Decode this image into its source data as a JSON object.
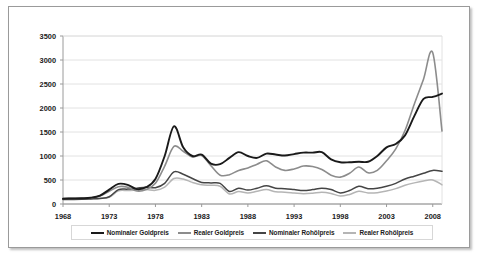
{
  "chart_data": {
    "type": "line",
    "title": "",
    "subtitle": "",
    "xlabel": "",
    "ylabel": "",
    "xlim": [
      1968,
      2009
    ],
    "ylim": [
      0,
      3500
    ],
    "ytick_step": 500,
    "yticks": [
      "0",
      "500",
      "1000",
      "1500",
      "2000",
      "2500",
      "3000",
      "3500"
    ],
    "xticks": [
      "1968",
      "1973",
      "1978",
      "1983",
      "1988",
      "1993",
      "1998",
      "2003",
      "2008"
    ],
    "grid": true,
    "grid_axis": "y",
    "legend_position": "bottom",
    "x": [
      1968,
      1969,
      1970,
      1971,
      1972,
      1973,
      1974,
      1975,
      1976,
      1977,
      1978,
      1979,
      1980,
      1981,
      1982,
      1983,
      1984,
      1985,
      1986,
      1987,
      1988,
      1989,
      1990,
      1991,
      1992,
      1993,
      1994,
      1995,
      1996,
      1997,
      1998,
      1999,
      2000,
      2001,
      2002,
      2003,
      2004,
      2005,
      2006,
      2007,
      2008,
      2009
    ],
    "series": [
      {
        "name": "Nominaler Goldpreis",
        "color": "#1a1a1a",
        "width": 1.9,
        "values": [
          110,
          115,
          120,
          130,
          175,
          300,
          420,
          400,
          310,
          350,
          520,
          1000,
          1620,
          1180,
          1000,
          1030,
          840,
          830,
          960,
          1080,
          1000,
          960,
          1050,
          1030,
          1010,
          1040,
          1070,
          1070,
          1080,
          930,
          870,
          870,
          880,
          880,
          1000,
          1180,
          1250,
          1430,
          1830,
          2190,
          2230,
          2300
        ]
      },
      {
        "name": "Realer Goldpreis",
        "color": "#8c8c8c",
        "width": 1.6,
        "values": [
          115,
          118,
          120,
          128,
          165,
          265,
          360,
          350,
          270,
          300,
          430,
          790,
          1200,
          1100,
          980,
          1010,
          800,
          600,
          610,
          700,
          750,
          830,
          900,
          770,
          700,
          730,
          790,
          780,
          720,
          600,
          560,
          640,
          770,
          650,
          700,
          900,
          1150,
          1530,
          2080,
          2600,
          3150,
          1520
        ]
      },
      {
        "name": "Nominaler Rohölpreis",
        "color": "#454545",
        "width": 1.5,
        "values": [
          95,
          95,
          97,
          105,
          115,
          150,
          300,
          310,
          330,
          350,
          340,
          430,
          670,
          620,
          530,
          450,
          440,
          430,
          260,
          330,
          290,
          330,
          380,
          330,
          320,
          300,
          280,
          300,
          330,
          300,
          230,
          280,
          370,
          320,
          330,
          370,
          430,
          520,
          580,
          640,
          700,
          680
        ]
      },
      {
        "name": "Realer Rohölpreis",
        "color": "#b5b5b5",
        "width": 1.5,
        "values": [
          100,
          100,
          102,
          108,
          118,
          140,
          275,
          280,
          290,
          300,
          285,
          350,
          530,
          520,
          450,
          400,
          390,
          370,
          210,
          260,
          230,
          265,
          300,
          255,
          245,
          230,
          215,
          225,
          245,
          220,
          165,
          200,
          265,
          230,
          235,
          270,
          320,
          390,
          440,
          480,
          500,
          400
        ]
      }
    ]
  },
  "legend": {
    "items": [
      {
        "label": "Nominaler Goldpreis",
        "color": "#1a1a1a"
      },
      {
        "label": "Realer Goldpreis",
        "color": "#8c8c8c"
      },
      {
        "label": "Nominaler Rohölpreis",
        "color": "#454545"
      },
      {
        "label": "Realer Rohölpreis",
        "color": "#b5b5b5"
      }
    ]
  },
  "colors": {
    "plot_border": "#bfbfbf",
    "gridline": "#e2e2e2",
    "axis_text": "#1a1a1a",
    "frame_border": "#9a9a9a",
    "background": "#ffffff"
  }
}
